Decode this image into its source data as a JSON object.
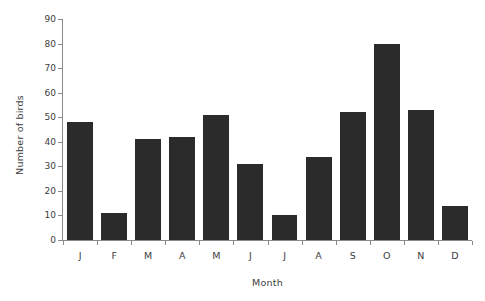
{
  "chart_data": {
    "type": "bar",
    "title": "",
    "subtitle": "",
    "xlabel": "Month",
    "ylabel": "Number of birds",
    "categories": [
      "J",
      "F",
      "M",
      "A",
      "M",
      "J",
      "J",
      "A",
      "S",
      "O",
      "N",
      "D"
    ],
    "values": [
      48,
      11,
      41,
      42,
      51,
      31,
      10,
      34,
      52,
      80,
      53,
      14
    ],
    "ylim": [
      0,
      90
    ],
    "y_ticks": [
      0,
      10,
      20,
      30,
      40,
      50,
      60,
      70,
      80,
      90
    ],
    "y_tick_labels": [
      "0",
      "10",
      "20",
      "30",
      "40",
      "50",
      "60",
      "70",
      "80",
      "90"
    ],
    "grid": false,
    "legend": false,
    "legend_position": "none",
    "annotations": [],
    "colors": {
      "bar": "#2b2b2b",
      "axis": "#8a8a8a",
      "text": "#3d3d3d",
      "background": "#ffffff"
    }
  }
}
